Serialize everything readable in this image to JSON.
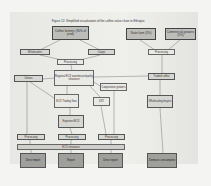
{
  "figure": {
    "title": "Figure 12: Simplified visualization of the coffee value chain in Ethiopia"
  },
  "nodes": {
    "coffee_farmers": "Coffee farmers (90% of prod)",
    "state_farm": "State farm (5%)",
    "commercial_growers": "Commercial growers (5%)",
    "wholesalers": "Wholesalers",
    "coops": "Coops",
    "processing_left": "Processing",
    "processing_right": "Processing",
    "regional_ecx": "Regional ECX warehouse/quality clearance",
    "unions": "Unions",
    "cooperative_growers": "Cooperative growers",
    "traded_coffee": "Traded coffee",
    "ecx_trading_floor": "ECX Trading floor",
    "dst": "DST",
    "wholesaling_buyers": "Wholesaling buyers",
    "exporters": "Exporters/ECX",
    "processing_1": "Processing",
    "processing_2": "Processing",
    "processing_3": "Processing",
    "ecx_clearance": "ECX clearance",
    "direct_import": "Direct import",
    "export": "Export",
    "direct_export": "Direct export",
    "domestic_consumption": "Domestic consumption"
  },
  "colors": {
    "major_box": "#bdbdba",
    "minor_box": "#d6d6d3",
    "bottom_box": "#9f9f9c",
    "line": "#666666"
  }
}
